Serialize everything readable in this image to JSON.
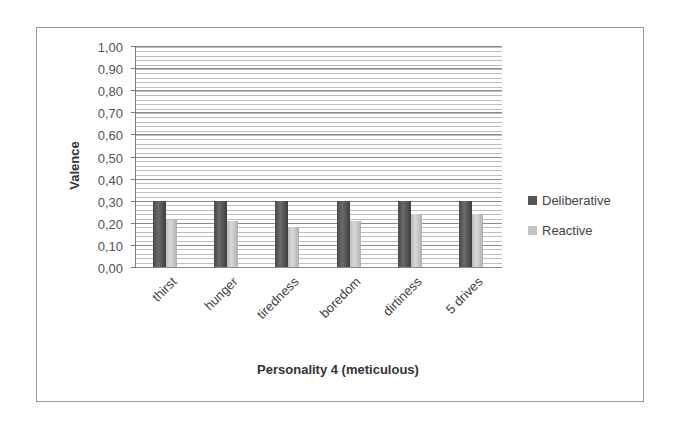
{
  "chart_data": {
    "type": "bar",
    "title": "",
    "xlabel": "Personality 4 (meticulous)",
    "ylabel": "Valence",
    "ylim": [
      0,
      1
    ],
    "yticks": [
      "0,00",
      "0,10",
      "0,20",
      "0,30",
      "0,40",
      "0,50",
      "0,60",
      "0,70",
      "0,80",
      "0,90",
      "1,00"
    ],
    "categories": [
      "thirst",
      "hunger",
      "tiredness",
      "boredom",
      "dirtiness",
      "5 drives"
    ],
    "series": [
      {
        "name": "Deliberative",
        "color": "#555555",
        "values": [
          0.3,
          0.3,
          0.3,
          0.3,
          0.3,
          0.3
        ]
      },
      {
        "name": "Reactive",
        "color": "#c4c4c4",
        "values": [
          0.215,
          0.21,
          0.18,
          0.21,
          0.24,
          0.24
        ]
      }
    ],
    "grid": true,
    "legend_position": "right"
  },
  "legend": {
    "deliberative": "Deliberative",
    "reactive": "Reactive"
  },
  "axis": {
    "x_title": "Personality 4 (meticulous)",
    "y_title": "Valence"
  }
}
